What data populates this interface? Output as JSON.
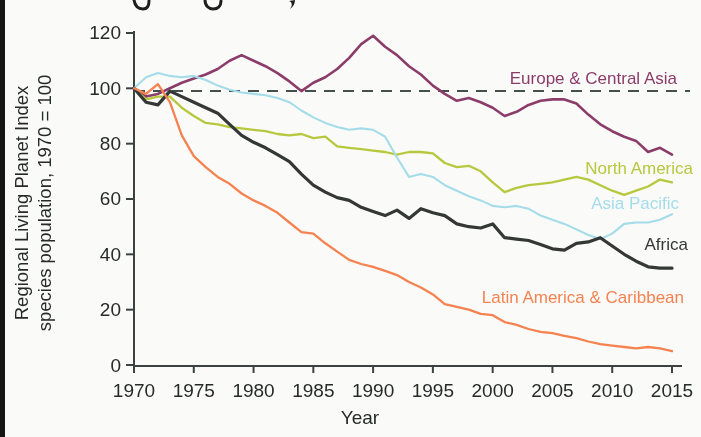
{
  "chart_data": {
    "type": "line",
    "xlabel": "Year",
    "ylabel_line1": "Regional Living Planet Index",
    "ylabel_line2": "species population, 1970 = 100",
    "x_start": 1970,
    "x_end": 2015,
    "xticks": [
      1970,
      1975,
      1980,
      1985,
      1990,
      1995,
      2000,
      2005,
      2010,
      2015
    ],
    "yticks": [
      0,
      20,
      40,
      60,
      80,
      100,
      120
    ],
    "ylim": [
      0,
      120
    ],
    "grid": false,
    "legend_position": "inline-right-labels",
    "reference_line": {
      "value": 100,
      "style": "dashed",
      "color": "#44504e"
    },
    "series": [
      {
        "name": "Europe & Central Asia",
        "color": "#8c3c69",
        "line_width": 2.6,
        "label_pos": {
          "x": 677,
          "y": 84,
          "anchor": "end"
        },
        "values": [
          100,
          97,
          98,
          100,
          102,
          103.5,
          105,
          107,
          110,
          112,
          110,
          108,
          105.5,
          102.5,
          99,
          102,
          104,
          107,
          111,
          116,
          119,
          115,
          112,
          108,
          105,
          101,
          98,
          95.5,
          96.5,
          95,
          93,
          90,
          91.5,
          94,
          95.5,
          96,
          96,
          94.5,
          90.5,
          87,
          84.5,
          82.5,
          81,
          77,
          78.5,
          76
        ]
      },
      {
        "name": "North America",
        "color": "#b7c83e",
        "line_width": 2.3,
        "label_pos": {
          "x": 693,
          "y": 174,
          "anchor": "end"
        },
        "values": [
          100,
          96,
          97,
          97,
          93,
          90,
          87.5,
          87,
          86,
          85.5,
          85,
          84.5,
          83.5,
          83,
          83.5,
          82,
          82.5,
          79,
          78.5,
          78,
          77.5,
          77,
          76,
          77,
          77,
          76.5,
          73,
          71.5,
          72,
          70,
          66,
          62.5,
          64,
          65,
          65.5,
          66,
          67,
          68,
          67,
          65,
          63,
          61.5,
          63,
          64.5,
          67,
          66
        ]
      },
      {
        "name": "Asia Pacific",
        "color": "#a5dce9",
        "line_width": 2.1,
        "label_pos": {
          "x": 679,
          "y": 209,
          "anchor": "end"
        },
        "values": [
          100,
          104,
          105.5,
          104.5,
          104,
          104.5,
          103,
          101,
          99.5,
          98.5,
          98,
          97.5,
          96.5,
          95,
          92,
          89.5,
          87.5,
          86,
          85,
          85.5,
          85,
          82.5,
          75,
          68,
          69,
          68,
          65,
          63,
          61,
          59.5,
          57.5,
          57,
          57.5,
          56.5,
          54,
          52.5,
          51,
          49,
          47,
          45.5,
          47.5,
          51,
          51.5,
          51.5,
          52.5,
          54.5
        ]
      },
      {
        "name": "Africa",
        "color": "#333837",
        "line_width": 3.2,
        "label_pos": {
          "x": 688,
          "y": 250,
          "anchor": "end"
        },
        "values": [
          100,
          95,
          94,
          99,
          97,
          95,
          93,
          91,
          87,
          83,
          80.5,
          78.5,
          76,
          73.5,
          69,
          65,
          62.5,
          60.5,
          59.5,
          57,
          55.5,
          54,
          56,
          53,
          56.5,
          55,
          54,
          51,
          50,
          49.5,
          51,
          46,
          45.5,
          45,
          43.5,
          42,
          41.5,
          44,
          44.5,
          46,
          43,
          40,
          37.5,
          35.5,
          35,
          35
        ]
      },
      {
        "name": "Latin America & Caribbean",
        "color": "#f58250",
        "line_width": 2.3,
        "label_pos": {
          "x": 684,
          "y": 303,
          "anchor": "end"
        },
        "values": [
          100,
          98,
          101.5,
          95,
          83,
          75.5,
          71.5,
          68,
          65.5,
          62,
          59.5,
          57.5,
          55,
          51.5,
          48,
          47.5,
          44,
          41,
          38,
          36.5,
          35.5,
          34,
          32.5,
          30,
          28,
          25.5,
          22,
          21,
          20,
          18.5,
          18,
          15.5,
          14.5,
          13,
          12,
          11.5,
          10.5,
          9.7,
          8.5,
          7.5,
          7,
          6.5,
          6,
          6.5,
          6,
          5
        ]
      }
    ]
  },
  "page": {
    "edge_color": "#151515",
    "axis_color": "#3a4341",
    "text_color": "#262b2a"
  }
}
